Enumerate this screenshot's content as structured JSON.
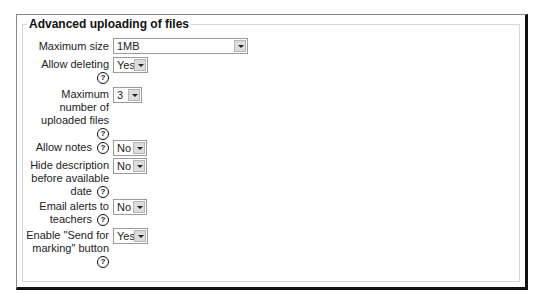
{
  "fieldset": {
    "legend": "Advanced uploading of files",
    "fields": [
      {
        "label": "Maximum size",
        "value": "1MB",
        "help": true
      },
      {
        "label": "Allow deleting",
        "value": "Yes",
        "help": true
      },
      {
        "label_lines": [
          "Maximum",
          "number of",
          "uploaded files"
        ],
        "label": "Maximum number of uploaded files",
        "value": "3",
        "help": true
      },
      {
        "label": "Allow notes",
        "value": "No",
        "help": true
      },
      {
        "label_lines": [
          "Hide description",
          "before available",
          "date"
        ],
        "label": "Hide description before available date",
        "value": "No",
        "help": true
      },
      {
        "label_lines": [
          "Email alerts to",
          "teachers"
        ],
        "label": "Email alerts to teachers",
        "value": "No",
        "help": true
      },
      {
        "label_lines": [
          "Enable \"Send for",
          "marking\" button"
        ],
        "label": "Enable \"Send for marking\" button",
        "value": "Yes",
        "help": true
      }
    ]
  },
  "icons": {
    "help": "?",
    "dropdown": "chevron-down"
  }
}
